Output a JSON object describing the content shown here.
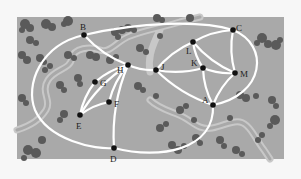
{
  "diagram": {
    "type": "trail-map-graph",
    "background_color": "#a9a9a9",
    "trail_color": "#ffffff",
    "stream_color": "#c4c4c4",
    "tree_color": "#5a5a5a",
    "node_color": "#111111",
    "nodes": [
      {
        "id": "A",
        "label": "A",
        "x": 213,
        "y": 105,
        "lx": 202,
        "ly": 103
      },
      {
        "id": "B",
        "label": "B",
        "x": 84,
        "y": 35,
        "lx": 80,
        "ly": 30
      },
      {
        "id": "C",
        "label": "C",
        "x": 233,
        "y": 30,
        "lx": 236,
        "ly": 31
      },
      {
        "id": "D",
        "label": "D",
        "x": 114,
        "y": 148,
        "lx": 110,
        "ly": 162
      },
      {
        "id": "E",
        "label": "E",
        "x": 80,
        "y": 115,
        "lx": 76,
        "ly": 129
      },
      {
        "id": "F",
        "label": "F",
        "x": 109,
        "y": 102,
        "lx": 114,
        "ly": 107
      },
      {
        "id": "G",
        "label": "G",
        "x": 95,
        "y": 82,
        "lx": 100,
        "ly": 86
      },
      {
        "id": "H",
        "label": "H",
        "x": 128,
        "y": 65,
        "lx": 117,
        "ly": 73
      },
      {
        "id": "J",
        "label": "J",
        "x": 156,
        "y": 70,
        "lx": 161,
        "ly": 70
      },
      {
        "id": "K",
        "label": "K",
        "x": 203,
        "y": 68,
        "lx": 191,
        "ly": 66
      },
      {
        "id": "L",
        "label": "L",
        "x": 193,
        "y": 42,
        "lx": 186,
        "ly": 54
      },
      {
        "id": "M",
        "label": "M",
        "x": 235,
        "y": 73,
        "lx": 240,
        "ly": 77
      }
    ],
    "edges": [
      [
        "B",
        "C"
      ],
      [
        "B",
        "H"
      ],
      [
        "B",
        "E"
      ],
      [
        "B",
        "A"
      ],
      [
        "C",
        "L"
      ],
      [
        "C",
        "M"
      ],
      [
        "C",
        "A"
      ],
      [
        "L",
        "J"
      ],
      [
        "L",
        "K"
      ],
      [
        "L",
        "M"
      ],
      [
        "H",
        "J"
      ],
      [
        "H",
        "G"
      ],
      [
        "H",
        "F"
      ],
      [
        "H",
        "D"
      ],
      [
        "H",
        "E"
      ],
      [
        "J",
        "K"
      ],
      [
        "J",
        "A"
      ],
      [
        "K",
        "M"
      ],
      [
        "K",
        "A"
      ],
      [
        "M",
        "A"
      ],
      [
        "G",
        "E"
      ],
      [
        "F",
        "E"
      ],
      [
        "E",
        "D"
      ],
      [
        "D",
        "A"
      ]
    ]
  }
}
